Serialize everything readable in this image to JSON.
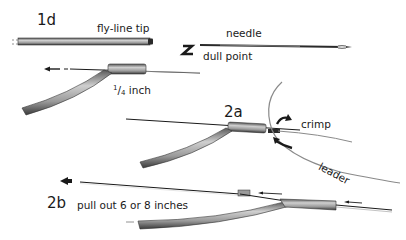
{
  "figure": {
    "background": "#ffffff",
    "ink_color": "#1a1a1a",
    "line_gray": "#9a9a9a",
    "steps": {
      "step_1d": {
        "label": "1d"
      },
      "step_2a": {
        "label": "2a"
      },
      "step_2b": {
        "label": "2b"
      }
    },
    "labels": {
      "fly_line_tip": "fly-line tip",
      "needle": "needle",
      "dull_point": "dull point",
      "quarter_inch_num": "1",
      "quarter_inch_slash": "/",
      "quarter_inch_den": "4",
      "quarter_inch_unit": " inch",
      "crimp": "crimp",
      "leader": "leader",
      "pull_out": "pull out 6 or 8 inches"
    },
    "icons": [
      "fly-line-icon",
      "needle-icon",
      "reverse-arrow-icon",
      "left-arrow-icon",
      "crimp-arrows-icon",
      "leader-line-icon"
    ]
  }
}
